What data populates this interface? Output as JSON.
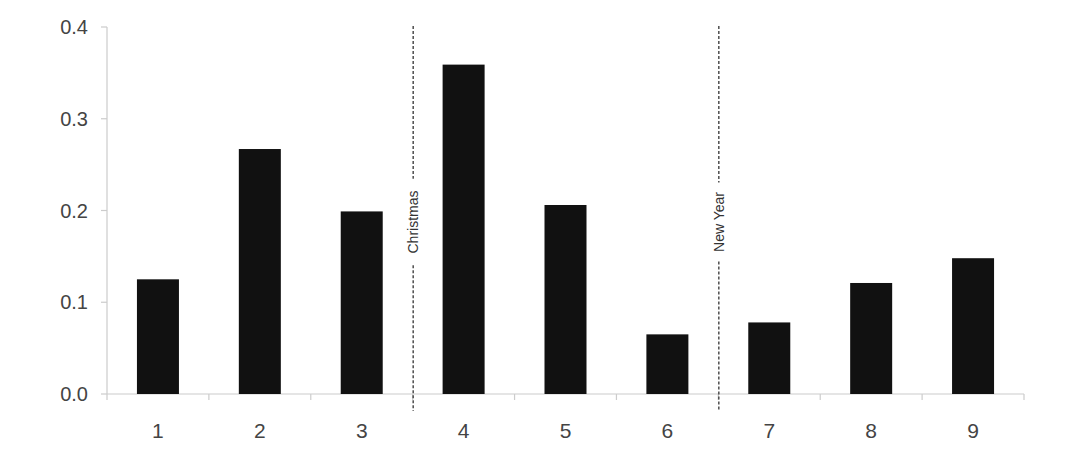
{
  "chart_data": {
    "type": "bar",
    "title": "",
    "xlabel": "",
    "ylabel": "",
    "categories": [
      "1",
      "2",
      "3",
      "4",
      "5",
      "6",
      "7",
      "8",
      "9"
    ],
    "values": [
      0.125,
      0.267,
      0.199,
      0.359,
      0.206,
      0.065,
      0.078,
      0.121,
      0.148
    ],
    "ylim": [
      0.0,
      0.4
    ],
    "yticks": [
      "0.0",
      "0.1",
      "0.2",
      "0.3",
      "0.4"
    ],
    "grid": false,
    "legend": null,
    "bar_color": "#111111",
    "axis_color": "#cccccc",
    "annotations": [
      {
        "label": "Christmas",
        "position_between": [
          "3",
          "4"
        ],
        "style": "dashed vertical line"
      },
      {
        "label": "New Year",
        "position_between": [
          "6",
          "7"
        ],
        "style": "dashed vertical line"
      }
    ]
  }
}
